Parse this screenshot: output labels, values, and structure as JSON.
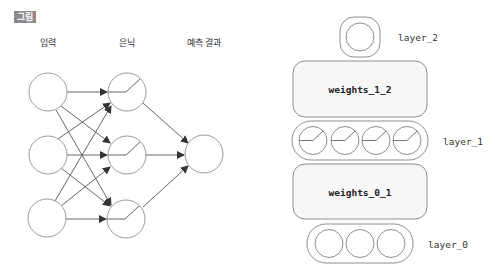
{
  "figure": {
    "badge": "그림",
    "colors": {
      "stroke": "#9a9a9a",
      "arrow": "#444444",
      "box_fill": "#f7f7f7",
      "badge_bg": "#8a8a8a"
    }
  },
  "network": {
    "column_labels": {
      "input": "입력",
      "hidden": "은닉",
      "output": "예측 결과"
    },
    "input_nodes": 3,
    "hidden_nodes": 3,
    "output_nodes": 1,
    "hidden_activation": "relu-icon"
  },
  "stack": {
    "layer_2": {
      "label": "layer_2",
      "nodes": 1
    },
    "weights_1_2": {
      "label": "weights_1_2"
    },
    "layer_1": {
      "label": "layer_1",
      "nodes": 4,
      "activation": "relu-icon"
    },
    "weights_0_1": {
      "label": "weights_0_1"
    },
    "layer_0": {
      "label": "layer_0",
      "nodes": 3
    }
  }
}
